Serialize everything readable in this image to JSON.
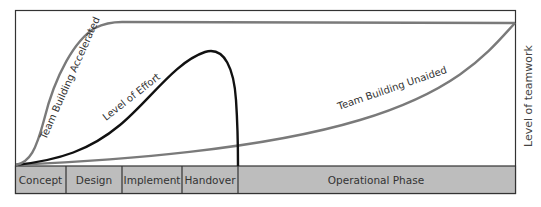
{
  "diagram": {
    "title": "",
    "y_axis_label": "Level of teamwork",
    "curves": [
      {
        "id": "accelerated",
        "label": "Team Building Accelerated",
        "color": "#7a7a7a"
      },
      {
        "id": "effort",
        "label": "Level of Effort",
        "color": "#111111"
      },
      {
        "id": "unaided",
        "label": "Team Building Unaided",
        "color": "#7a7a7a"
      }
    ],
    "phases": [
      {
        "label": "Concept"
      },
      {
        "label": "Design"
      },
      {
        "label": "Implement"
      },
      {
        "label": "Handover"
      },
      {
        "label": "Operational Phase"
      }
    ],
    "colors": {
      "phase_bar": "#bdbdbd",
      "frame": "#333333",
      "background": "#ffffff"
    }
  }
}
